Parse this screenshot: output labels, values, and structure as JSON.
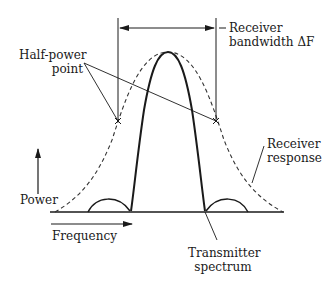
{
  "diagram": {
    "labels": {
      "receiver_bandwidth_line1": "Receiver",
      "receiver_bandwidth_line2": "bandwidth ΔF",
      "half_power_line1": "Half-power",
      "half_power_line2": "point",
      "receiver_response_line1": "Receiver",
      "receiver_response_line2": "response",
      "power_axis": "Power",
      "frequency_axis": "Frequency",
      "transmitter_spectrum_line1": "Transmitter",
      "transmitter_spectrum_line2": "spectrum"
    },
    "colors": {
      "line": "#1a1a1a",
      "dashed": "#333333",
      "background": "#ffffff"
    },
    "elements": [
      {
        "name": "receiver-response-curve",
        "style": "dashed"
      },
      {
        "name": "transmitter-spectrum-main-lobe",
        "style": "solid-bold"
      },
      {
        "name": "transmitter-left-sidelobe",
        "style": "solid"
      },
      {
        "name": "transmitter-right-sidelobe",
        "style": "solid"
      },
      {
        "name": "half-power-markers",
        "style": "x"
      },
      {
        "name": "bandwidth-arrow",
        "style": "double-arrow"
      }
    ]
  }
}
